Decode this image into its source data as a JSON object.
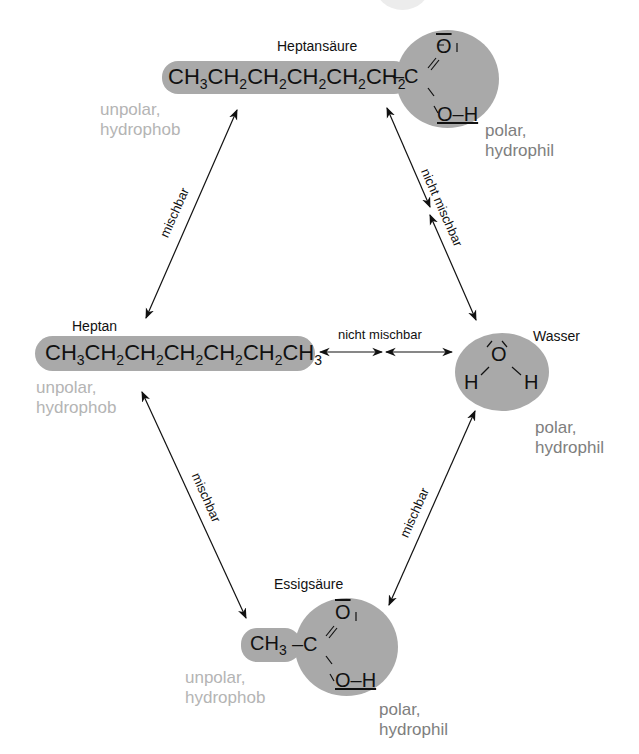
{
  "diagram": {
    "type": "miscibility-diagram",
    "colors": {
      "molecule_fill": "#a9a9a9",
      "unpolar_text": "#b4b4b4",
      "polar_text": "#7e7e7e",
      "arrow": "#111111"
    },
    "nodes": {
      "heptansaeure": {
        "name": "Heptansäure",
        "formula_chain": [
          "CH",
          "3",
          "CH",
          "2",
          "CH",
          "2",
          "CH",
          "2",
          "CH",
          "2",
          "CH",
          "2"
        ],
        "bond": "–C",
        "carbonyl_o": "O",
        "hydroxyl": "O–H",
        "unpolar_part": {
          "line1": "unpolar,",
          "line2": "hydrophob"
        },
        "polar_part": {
          "line1": "polar,",
          "line2": "hydrophil"
        }
      },
      "heptan": {
        "name": "Heptan",
        "formula": "CH3CH2CH2CH2CH2CH2CH3",
        "unpolar_part": {
          "line1": "unpolar,",
          "line2": "hydrophob"
        }
      },
      "wasser": {
        "name": "Wasser",
        "oxygen": "O",
        "hydrogen_left": "H",
        "hydrogen_right": "H",
        "polar_part": {
          "line1": "polar,",
          "line2": "hydrophil"
        }
      },
      "essigsaeure": {
        "name": "Essigsäure",
        "methyl": "CH3",
        "bond": "–C",
        "carbonyl_o": "O",
        "hydroxyl": "O–H",
        "unpolar_part": {
          "line1": "unpolar,",
          "line2": "hydrophob"
        },
        "polar_part": {
          "line1": "polar,",
          "line2": "hydrophil"
        }
      }
    },
    "relations": [
      {
        "from": "heptansaeure",
        "to": "heptan",
        "label": "mischbar"
      },
      {
        "from": "heptansaeure",
        "to": "wasser",
        "label": "nicht mischbar"
      },
      {
        "from": "heptan",
        "to": "wasser",
        "label": "nicht mischbar"
      },
      {
        "from": "heptan",
        "to": "essigsaeure",
        "label": "mischbar"
      },
      {
        "from": "wasser",
        "to": "essigsaeure",
        "label": "mischbar"
      }
    ]
  }
}
